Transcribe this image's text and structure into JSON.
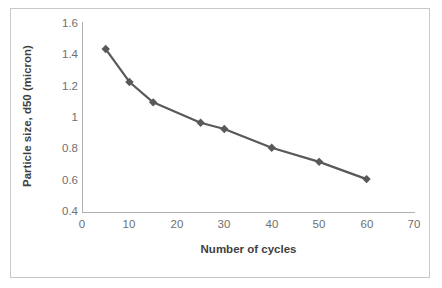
{
  "chart_data": {
    "type": "line",
    "title": "",
    "xlabel": "Number of cycles",
    "ylabel": "Particle size, d50 (micron)",
    "x": [
      5,
      10,
      15,
      25,
      30,
      40,
      50,
      60
    ],
    "values": [
      1.44,
      1.23,
      1.1,
      0.97,
      0.93,
      0.81,
      0.72,
      0.61
    ],
    "series": [
      {
        "name": "Particle size d50",
        "x": [
          5,
          10,
          15,
          25,
          30,
          40,
          50,
          60
        ],
        "values": [
          1.44,
          1.23,
          1.1,
          0.97,
          0.93,
          0.81,
          0.72,
          0.61
        ]
      }
    ],
    "xlim": [
      0,
      70
    ],
    "ylim": [
      0.4,
      1.6
    ],
    "xticks": [
      0,
      10,
      20,
      30,
      40,
      50,
      60,
      70
    ],
    "yticks": [
      0.4,
      0.6,
      0.8,
      1,
      1.2,
      1.4,
      1.6
    ],
    "xtick_labels": [
      "0",
      "10",
      "20",
      "30",
      "40",
      "50",
      "60",
      "70"
    ],
    "ytick_labels": [
      "0.4",
      "0.6",
      "0.8",
      "1",
      "1.2",
      "1.4",
      "1.6"
    ],
    "grid": false,
    "legend": false,
    "legend_position": "none",
    "marker": "diamond",
    "series_color": "#595959",
    "axis_color": "#b0b0b0",
    "tick_text_color": "#6f6f6f",
    "axis_title_color": "#3f3f3f",
    "border_color": "#c8c8c8",
    "background_color": "#ffffff"
  }
}
